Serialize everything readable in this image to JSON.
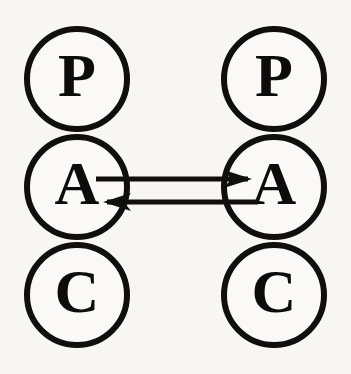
{
  "diagram": {
    "type": "transactional-analysis-pac-diagram",
    "background_color": "#f7f6f3",
    "ink_color": "#100f0d",
    "persons": [
      {
        "id": "left",
        "name": "Person 1",
        "center_x": 77,
        "ego_states": [
          {
            "code": "P",
            "name": "Parent",
            "cx": 77,
            "cy": 79,
            "r": 50
          },
          {
            "code": "A",
            "name": "Adult",
            "cx": 77,
            "cy": 187,
            "r": 50
          },
          {
            "code": "C",
            "name": "Child",
            "cx": 77,
            "cy": 295,
            "r": 50
          }
        ]
      },
      {
        "id": "right",
        "name": "Person 2",
        "center_x": 274,
        "ego_states": [
          {
            "code": "P",
            "name": "Parent",
            "cx": 274,
            "cy": 79,
            "r": 50
          },
          {
            "code": "A",
            "name": "Adult",
            "cx": 274,
            "cy": 187,
            "r": 50
          },
          {
            "code": "C",
            "name": "Child",
            "cx": 274,
            "cy": 295,
            "r": 50
          }
        ]
      }
    ],
    "transactions": [
      {
        "id": "stimulus",
        "label": "stimulus",
        "direction": "left-to-right",
        "from": "left-adult",
        "to": "right-adult",
        "y": 179,
        "x_start": 96,
        "x_end": 252
      },
      {
        "id": "response",
        "label": "response",
        "direction": "right-to-left",
        "from": "right-adult",
        "to": "left-adult",
        "y": 202,
        "x_start": 258,
        "x_end": 103
      }
    ]
  }
}
